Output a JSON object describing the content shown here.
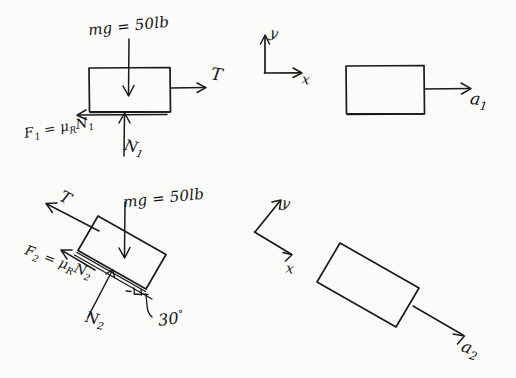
{
  "document": {
    "title": "Free-body and kinetic diagrams for two blocks",
    "background_color": "#fbfbfa",
    "ink_color": "#1a1a1a"
  },
  "diagram1_fbd": {
    "name": "free-body-diagram-block-1",
    "weight_label": "mg = 50lb",
    "tension_label": "T",
    "friction_label_base": "F",
    "friction_label_sub": "1",
    "friction_label_expr": " = μ",
    "friction_label_mu_sub": "R",
    "friction_label_n": "N",
    "friction_label_n_sub": "1",
    "normal_label_base": "N",
    "normal_label_sub": "1"
  },
  "diagram1_kinetic": {
    "name": "kinetic-diagram-block-1",
    "axis_y": "y",
    "axis_x": "x",
    "accel_label_base": "a",
    "accel_label_sub": "1"
  },
  "diagram2_fbd": {
    "name": "free-body-diagram-block-2",
    "weight_label": "mg = 50lb",
    "tension_label": "T",
    "friction_label_base": "F",
    "friction_label_sub": "2",
    "friction_label_expr": " = μ",
    "friction_label_mu_sub": "R",
    "friction_label_n": "N",
    "friction_label_n_sub": "2",
    "normal_label_base": "N",
    "normal_label_sub": "2",
    "angle_label": "30",
    "angle_unit": "°"
  },
  "diagram2_kinetic": {
    "name": "kinetic-diagram-block-2",
    "axis_y": "y",
    "axis_x": "x",
    "accel_label_base": "a",
    "accel_label_sub": "2"
  }
}
